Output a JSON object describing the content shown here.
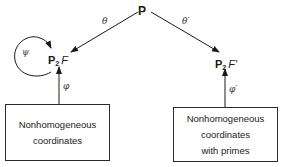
{
  "diagram": {
    "top_node": {
      "label": "P"
    },
    "left_node": {
      "space": "P",
      "subscript": "2",
      "field": "F"
    },
    "right_node": {
      "space": "P",
      "subscript": "2",
      "field": "F′"
    },
    "edges": {
      "theta": "θ",
      "theta_prime": "θ′",
      "psi_loop": "ψ",
      "phi": "φ",
      "phi_prime": "φ′"
    },
    "left_box": {
      "lines": [
        "Nonhomogeneous",
        "coordinates"
      ]
    },
    "right_box": {
      "lines": [
        "Nonhomogeneous",
        "coordinates",
        "with primes"
      ]
    },
    "colors": {
      "ink": "#1a1a1a",
      "background": "#ffffff"
    }
  }
}
